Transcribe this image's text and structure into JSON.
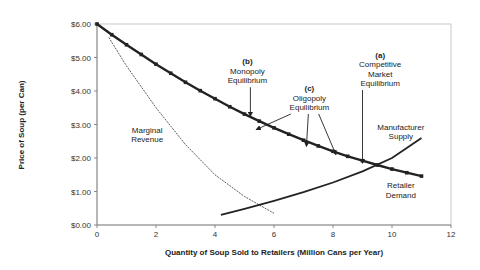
{
  "chart_data": {
    "type": "line",
    "title": "",
    "xlabel": "Quantity of Soup Sold to Retailers (Million Cans per Year)",
    "ylabel": "Price of Soup (per Can)",
    "xlim": [
      0,
      12
    ],
    "ylim": [
      0,
      6
    ],
    "x_ticks": [
      "0",
      "2",
      "4",
      "6",
      "8",
      "10",
      "12"
    ],
    "y_ticks": [
      "$0.00",
      "$1.00",
      "$2.00",
      "$3.00",
      "$4.00",
      "$5.00",
      "$6.00"
    ],
    "grid": false,
    "series": [
      {
        "name": "Retailer Demand",
        "style": "thick-marked",
        "x": [
          0,
          0.5,
          1,
          1.5,
          2,
          2.5,
          3,
          3.5,
          4,
          4.5,
          5,
          5.5,
          6,
          6.5,
          7,
          7.5,
          8,
          8.5,
          9,
          9.5,
          10,
          10.5,
          11
        ],
        "y": [
          6.0,
          5.68,
          5.38,
          5.09,
          4.8,
          4.53,
          4.26,
          4.01,
          3.77,
          3.53,
          3.31,
          3.1,
          2.9,
          2.71,
          2.53,
          2.36,
          2.2,
          2.05,
          1.92,
          1.79,
          1.67,
          1.56,
          1.46
        ]
      },
      {
        "name": "Marginal Revenue",
        "style": "dashed",
        "x": [
          0.4,
          1,
          2,
          3,
          4,
          5,
          6
        ],
        "y": [
          5.6,
          4.75,
          3.5,
          2.4,
          1.5,
          0.85,
          0.35
        ]
      },
      {
        "name": "Manufacturer Supply",
        "style": "solid",
        "x": [
          4.2,
          5,
          6,
          7,
          8,
          9,
          10,
          11
        ],
        "y": [
          0.3,
          0.48,
          0.72,
          0.98,
          1.27,
          1.6,
          2.0,
          2.6
        ]
      }
    ],
    "annotations": [
      {
        "id": "mr",
        "lines": [
          "Marginal",
          "Revenue"
        ],
        "x": 1.7,
        "y": 2.75
      },
      {
        "id": "mono",
        "lines": [
          "(b)",
          "Monopoly",
          "Equilibrium"
        ],
        "x": 5.1,
        "y": 4.8,
        "arrow_to": [
          5.2,
          3.25
        ]
      },
      {
        "id": "oli",
        "lines": [
          "(c)",
          "Oligopoly",
          "Equilibrium"
        ],
        "x": 7.2,
        "y": 4.0,
        "arrows_to": [
          [
            5.4,
            2.85
          ],
          [
            7.1,
            2.35
          ],
          [
            8.1,
            2.1
          ]
        ]
      },
      {
        "id": "comp",
        "lines": [
          "(a)",
          "Competitive",
          "Market",
          "Equilibrium"
        ],
        "x": 9.6,
        "y": 5.0,
        "arrow_to": [
          9.0,
          1.85
        ]
      },
      {
        "id": "supply",
        "lines": [
          "Manufacturer",
          "Supply"
        ],
        "x": 10.3,
        "y": 2.85
      },
      {
        "id": "demand",
        "lines": [
          "Retailer",
          "Demand"
        ],
        "x": 10.3,
        "y": 1.1
      }
    ]
  }
}
